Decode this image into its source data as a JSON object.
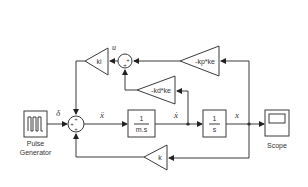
{
  "diagram": {
    "blocks": {
      "pulse_generator": {
        "label": "Pulse",
        "label2": "Generator"
      },
      "integrator_1": {
        "num": "1",
        "den": "m.s"
      },
      "integrator_2": {
        "num": "1",
        "den": "s"
      },
      "scope": {
        "label": "Scope"
      },
      "gain_ki": {
        "label": "ki"
      },
      "gain_kp": {
        "label": "-kp*ke"
      },
      "gain_kd": {
        "label": "-kd*ke"
      },
      "gain_k": {
        "label": "k"
      },
      "sum_main": {
        "signs": [
          "+",
          "+",
          "+"
        ],
        "sign_left": "+",
        "sign_top": "+",
        "sign_bottom": "+"
      },
      "sum_top": {
        "signs": [
          "+",
          "+"
        ],
        "sign_right": "+",
        "sign_bottom": "+"
      }
    },
    "signals": {
      "delta": "δ",
      "x_ddot": "ẍ",
      "x_dot": "ẋ",
      "x": "x",
      "u": "u"
    },
    "colors": {
      "stroke": "#3a3a3a",
      "text": "#333333",
      "background": "#ffffff"
    }
  }
}
